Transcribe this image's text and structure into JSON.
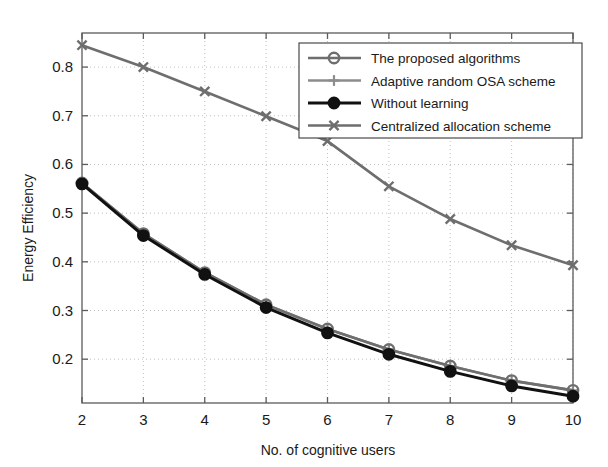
{
  "chart_data": {
    "type": "line",
    "title": "",
    "xlabel": "No. of cognitive users",
    "ylabel": "Energy Efficiency",
    "x": [
      2,
      3,
      4,
      5,
      6,
      7,
      8,
      9,
      10
    ],
    "xlim": [
      2,
      10
    ],
    "ylim": [
      0.11,
      0.87
    ],
    "xticks": [
      "2",
      "3",
      "4",
      "5",
      "6",
      "7",
      "8",
      "9",
      "10"
    ],
    "yticks": [
      "0.2",
      "0.3",
      "0.4",
      "0.5",
      "0.6",
      "0.7",
      "0.8"
    ],
    "ytick_values": [
      0.2,
      0.3,
      0.4,
      0.5,
      0.6,
      0.7,
      0.8
    ],
    "grid": true,
    "grid_style": "dotted",
    "legend_position": "top-right",
    "series": [
      {
        "name": "The proposed algorithms",
        "marker": "circle-open",
        "color": "#6e6e6e",
        "values": [
          0.562,
          0.458,
          0.378,
          0.312,
          0.262,
          0.22,
          0.186,
          0.156,
          0.136
        ]
      },
      {
        "name": "Adaptive random OSA scheme",
        "marker": "plus",
        "color": "#8c8c8c",
        "values": [
          0.562,
          0.458,
          0.378,
          0.312,
          0.262,
          0.22,
          0.186,
          0.156,
          0.136
        ]
      },
      {
        "name": "Without learning",
        "marker": "circle-filled",
        "color": "#111111",
        "values": [
          0.56,
          0.454,
          0.374,
          0.306,
          0.254,
          0.21,
          0.175,
          0.145,
          0.124
        ]
      },
      {
        "name": "Centralized allocation scheme",
        "marker": "x-cross",
        "color": "#6e6e6e",
        "values": [
          0.845,
          0.8,
          0.75,
          0.699,
          0.648,
          0.555,
          0.488,
          0.434,
          0.393
        ]
      }
    ]
  },
  "legend": {
    "items": [
      {
        "label": "The proposed algorithms"
      },
      {
        "label": "Adaptive random OSA scheme"
      },
      {
        "label": "Without learning"
      },
      {
        "label": "Centralized allocation scheme"
      }
    ]
  },
  "colors": {
    "axis": "#5b5b5b",
    "grid": "#b9b9b9",
    "text": "#1a1a1a",
    "gray_series": "#6e6e6e",
    "light_gray_series": "#8c8c8c",
    "black_series": "#111111",
    "background": "#ffffff"
  }
}
